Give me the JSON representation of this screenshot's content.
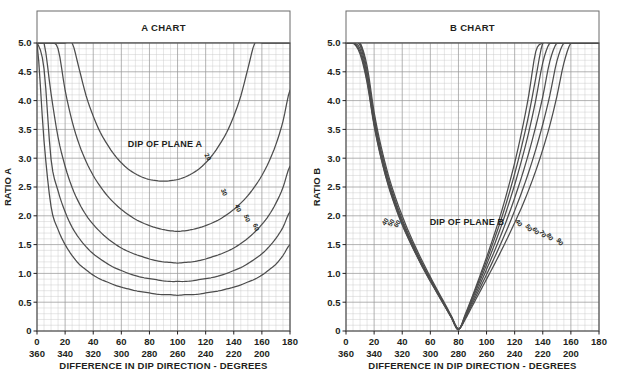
{
  "figure": {
    "background": "#ffffff",
    "ink": "#231f20",
    "grid_minor_color": "#c9c9c9",
    "grid_major_color": "#9a9a9a",
    "curve_color": "#4d4d4d"
  },
  "charts": [
    {
      "id": "chart-a",
      "title": "A CHART",
      "ylabel": "RATIO A",
      "xlabel": "DIFFERENCE IN DIP DIRECTION - DEGREES",
      "annotation": "DIP OF PLANE A",
      "xticks_top": [
        "0",
        "20",
        "40",
        "60",
        "80",
        "100",
        "120",
        "140",
        "160",
        "180"
      ],
      "xticks_bottom": [
        "360",
        "340",
        "320",
        "300",
        "280",
        "260",
        "240",
        "220",
        "200"
      ],
      "yticks": [
        "0",
        "0.5",
        "1.0",
        "1.5",
        "2.0",
        "2.5",
        "3.0",
        "3.5",
        "4.0",
        "4.5",
        "5.0"
      ],
      "curve_labels": [
        "20",
        "30",
        "40",
        "50",
        "60"
      ]
    },
    {
      "id": "chart-b",
      "title": "B CHART",
      "ylabel": "RATIO B",
      "xlabel": "DIFFERENCE IN DIP DIRECTION - DEGREES",
      "annotation": "DIP OF PLANE B",
      "xticks_top": [
        "0",
        "20",
        "40",
        "60",
        "80",
        "100",
        "120",
        "140",
        "160",
        "180"
      ],
      "xticks_bottom": [
        "360",
        "340",
        "320",
        "300",
        "280",
        "260",
        "240",
        "220",
        "200"
      ],
      "yticks": [
        "0",
        "0.5",
        "1.0",
        "1.5",
        "2.0",
        "2.5",
        "3.0",
        "3.5",
        "4.0",
        "4.5",
        "5.0"
      ],
      "curve_labels_left": [
        "40",
        "50",
        "60"
      ],
      "curve_labels_right": [
        "40",
        "50",
        "60",
        "70",
        "80",
        "90"
      ]
    }
  ],
  "chart_data": [
    {
      "type": "line",
      "id": "chart-a",
      "title": "A CHART",
      "xlabel": "DIFFERENCE IN DIP DIRECTION - DEGREES",
      "ylabel": "RATIO A",
      "xlim": [
        0,
        180
      ],
      "ylim": [
        0,
        5.0
      ],
      "xtick_step": 20,
      "ytick_step": 0.5,
      "minor_divisions": 4,
      "grid": true,
      "legend": "none",
      "annotation": "DIP OF PLANE A",
      "secondary_xaxis": {
        "labels": [
          "360",
          "340",
          "320",
          "300",
          "280",
          "260",
          "240",
          "220",
          "200"
        ],
        "note": "reciprocal azimuth scale beneath primary axis"
      },
      "x": [
        0,
        5,
        10,
        15,
        20,
        25,
        30,
        35,
        40,
        45,
        50,
        55,
        60,
        65,
        70,
        75,
        80,
        85,
        90,
        95,
        100,
        105,
        110,
        115,
        120,
        125,
        130,
        135,
        140,
        145,
        150,
        155,
        160,
        165,
        170,
        175,
        180
      ],
      "series": [
        {
          "name": "20",
          "label": "DIP OF PLANE A = 20°",
          "values": [
            5.0,
            5.0,
            5.0,
            5.0,
            5.0,
            5.0,
            4.55,
            4.08,
            3.73,
            3.45,
            3.24,
            3.06,
            2.92,
            2.81,
            2.73,
            2.67,
            2.63,
            2.61,
            2.6,
            2.61,
            2.63,
            2.67,
            2.73,
            2.81,
            2.92,
            3.06,
            3.24,
            3.45,
            3.73,
            4.08,
            4.55,
            5.0,
            5.0,
            5.0,
            5.0,
            5.0,
            5.0
          ]
        },
        {
          "name": "30",
          "label": "DIP OF PLANE A = 30°",
          "values": [
            5.0,
            5.0,
            5.0,
            4.9,
            4.18,
            3.64,
            3.24,
            2.94,
            2.7,
            2.51,
            2.35,
            2.22,
            2.11,
            2.02,
            1.94,
            1.88,
            1.83,
            1.79,
            1.76,
            1.74,
            1.73,
            1.74,
            1.76,
            1.79,
            1.83,
            1.88,
            1.94,
            2.02,
            2.11,
            2.22,
            2.35,
            2.51,
            2.7,
            2.94,
            3.24,
            3.64,
            4.18
          ]
        },
        {
          "name": "40",
          "label": "DIP OF PLANE A = 40°",
          "values": [
            5.0,
            5.0,
            4.12,
            3.36,
            2.86,
            2.49,
            2.22,
            2.01,
            1.85,
            1.72,
            1.61,
            1.52,
            1.44,
            1.38,
            1.33,
            1.29,
            1.25,
            1.22,
            1.2,
            1.19,
            1.18,
            1.19,
            1.2,
            1.22,
            1.25,
            1.29,
            1.33,
            1.38,
            1.44,
            1.52,
            1.61,
            1.72,
            1.85,
            2.01,
            2.22,
            2.49,
            2.86
          ]
        },
        {
          "name": "50",
          "label": "DIP OF PLANE A = 50°",
          "values": [
            5.0,
            4.55,
            2.98,
            2.43,
            2.07,
            1.8,
            1.61,
            1.46,
            1.34,
            1.25,
            1.17,
            1.1,
            1.05,
            1.0,
            0.96,
            0.93,
            0.91,
            0.89,
            0.87,
            0.86,
            0.86,
            0.86,
            0.87,
            0.89,
            0.91,
            0.93,
            0.96,
            1.0,
            1.05,
            1.1,
            1.17,
            1.25,
            1.34,
            1.46,
            1.61,
            1.8,
            2.07
          ]
        },
        {
          "name": "60",
          "label": "DIP OF PLANE A = 60°",
          "values": [
            5.0,
            3.3,
            2.16,
            1.76,
            1.5,
            1.31,
            1.16,
            1.06,
            0.97,
            0.9,
            0.85,
            0.8,
            0.76,
            0.73,
            0.7,
            0.68,
            0.66,
            0.64,
            0.63,
            0.63,
            0.62,
            0.63,
            0.63,
            0.64,
            0.66,
            0.68,
            0.7,
            0.73,
            0.76,
            0.8,
            0.85,
            0.9,
            0.97,
            1.06,
            1.16,
            1.31,
            1.5
          ]
        }
      ]
    },
    {
      "type": "line",
      "id": "chart-b",
      "title": "B CHART",
      "xlabel": "DIFFERENCE IN DIP DIRECTION - DEGREES",
      "ylabel": "RATIO B",
      "xlim": [
        0,
        180
      ],
      "ylim": [
        0,
        5.0
      ],
      "xtick_step": 20,
      "ytick_step": 0.5,
      "minor_divisions": 4,
      "grid": true,
      "legend": "none",
      "annotation": "DIP OF PLANE B",
      "secondary_xaxis": {
        "labels": [
          "360",
          "340",
          "320",
          "300",
          "280",
          "260",
          "240",
          "220",
          "200"
        ],
        "note": "reciprocal azimuth scale beneath primary axis"
      },
      "convergence_point": {
        "x": 80,
        "y": 0.0
      },
      "x": [
        0,
        5,
        10,
        15,
        20,
        25,
        30,
        35,
        40,
        45,
        50,
        55,
        60,
        65,
        70,
        75,
        80,
        85,
        90,
        95,
        100,
        105,
        110,
        115,
        120,
        125,
        130,
        135,
        140,
        145,
        150,
        155,
        160,
        165,
        170,
        175,
        180
      ],
      "series": [
        {
          "name": "40",
          "label": "DIP OF PLANE B = 40°",
          "values": [
            5.0,
            5.0,
            5.0,
            4.6,
            3.8,
            3.2,
            2.72,
            2.33,
            2.0,
            1.7,
            1.43,
            1.18,
            0.94,
            0.71,
            0.49,
            0.26,
            0.04,
            0.21,
            0.44,
            0.67,
            0.9,
            1.13,
            1.37,
            1.62,
            1.88,
            2.15,
            2.45,
            2.78,
            3.15,
            3.57,
            4.07,
            4.65,
            5.0,
            5.0,
            5.0,
            5.0,
            5.0
          ]
        },
        {
          "name": "50",
          "label": "DIP OF PLANE B = 50°",
          "values": [
            5.0,
            5.0,
            5.0,
            4.52,
            3.73,
            3.13,
            2.66,
            2.27,
            1.94,
            1.65,
            1.39,
            1.14,
            0.91,
            0.69,
            0.47,
            0.25,
            0.03,
            0.23,
            0.48,
            0.73,
            0.98,
            1.24,
            1.51,
            1.79,
            2.09,
            2.41,
            2.76,
            3.15,
            3.59,
            4.09,
            4.68,
            5.0,
            5.0,
            5.0,
            5.0,
            5.0,
            5.0
          ]
        },
        {
          "name": "60",
          "label": "DIP OF PLANE B = 60°",
          "values": [
            5.0,
            5.0,
            4.96,
            4.45,
            3.67,
            3.08,
            2.61,
            2.23,
            1.9,
            1.62,
            1.36,
            1.12,
            0.89,
            0.67,
            0.46,
            0.24,
            0.03,
            0.25,
            0.52,
            0.79,
            1.07,
            1.35,
            1.65,
            1.97,
            2.31,
            2.68,
            3.09,
            3.55,
            4.07,
            4.68,
            5.0,
            5.0,
            5.0,
            5.0,
            5.0,
            5.0,
            5.0
          ]
        },
        {
          "name": "70",
          "label": "DIP OF PLANE B = 70°",
          "values": [
            5.0,
            5.0,
            4.9,
            4.39,
            3.62,
            3.04,
            2.58,
            2.2,
            1.88,
            1.6,
            1.34,
            1.1,
            0.88,
            0.66,
            0.45,
            0.24,
            0.03,
            0.27,
            0.56,
            0.85,
            1.15,
            1.46,
            1.79,
            2.15,
            2.54,
            2.97,
            3.45,
            4.01,
            4.66,
            5.0,
            5.0,
            5.0,
            5.0,
            5.0,
            5.0,
            5.0,
            5.0
          ]
        },
        {
          "name": "80",
          "label": "DIP OF PLANE B = 80°",
          "values": [
            5.0,
            5.0,
            4.85,
            4.35,
            3.59,
            3.01,
            2.55,
            2.18,
            1.86,
            1.58,
            1.33,
            1.09,
            0.87,
            0.66,
            0.45,
            0.23,
            0.02,
            0.28,
            0.59,
            0.9,
            1.22,
            1.56,
            1.91,
            2.3,
            2.73,
            3.21,
            3.75,
            4.39,
            5.0,
            5.0,
            5.0,
            5.0,
            5.0,
            5.0,
            5.0,
            5.0,
            5.0
          ]
        },
        {
          "name": "90",
          "label": "DIP OF PLANE B = 90°",
          "values": [
            5.0,
            5.0,
            4.81,
            4.31,
            3.56,
            2.99,
            2.53,
            2.16,
            1.84,
            1.57,
            1.32,
            1.08,
            0.86,
            0.65,
            0.44,
            0.23,
            0.02,
            0.3,
            0.61,
            0.94,
            1.28,
            1.64,
            2.02,
            2.45,
            2.92,
            3.46,
            4.09,
            4.85,
            5.0,
            5.0,
            5.0,
            5.0,
            5.0,
            5.0,
            5.0,
            5.0,
            5.0
          ]
        }
      ]
    }
  ]
}
